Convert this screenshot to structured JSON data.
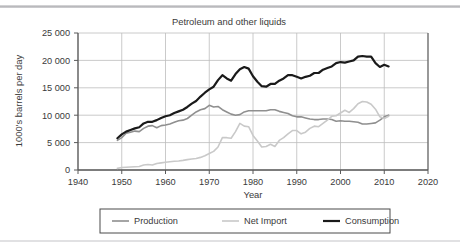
{
  "chart_data": {
    "type": "line",
    "title": "Petroleum and other liquids",
    "xlabel": "Year",
    "ylabel": "1000's barrels per day",
    "xlim": [
      1940,
      2020
    ],
    "ylim": [
      0,
      25000
    ],
    "xticks": [
      "1940",
      "1950",
      "1960",
      "1970",
      "1980",
      "1990",
      "2000",
      "2010",
      "2020"
    ],
    "yticks": [
      "0",
      "5 000",
      "10 000",
      "15 000",
      "20 000",
      "25 000"
    ],
    "grid": "both",
    "legend_position": "below",
    "series": [
      {
        "name": "Production",
        "color": "#8f8f8f",
        "width": 1.6,
        "x": [
          1949,
          1950,
          1951,
          1952,
          1953,
          1954,
          1955,
          1956,
          1957,
          1958,
          1959,
          1960,
          1961,
          1962,
          1963,
          1964,
          1965,
          1966,
          1967,
          1968,
          1969,
          1970,
          1971,
          1972,
          1973,
          1974,
          1975,
          1976,
          1977,
          1978,
          1979,
          1980,
          1981,
          1982,
          1983,
          1984,
          1985,
          1986,
          1987,
          1988,
          1989,
          1990,
          1991,
          1992,
          1993,
          1994,
          1995,
          1996,
          1997,
          1998,
          1999,
          2000,
          2001,
          2002,
          2003,
          2004,
          2005,
          2006,
          2007,
          2008,
          2009,
          2010,
          2011
        ],
        "y": [
          5400,
          5900,
          6700,
          6900,
          7100,
          7000,
          7600,
          8000,
          8100,
          7700,
          8100,
          8200,
          8400,
          8700,
          9000,
          9100,
          9400,
          10000,
          10600,
          11000,
          11200,
          11800,
          11500,
          11600,
          11000,
          10600,
          10200,
          10000,
          10100,
          10600,
          10800,
          10800,
          10800,
          10800,
          10800,
          11000,
          11000,
          10700,
          10500,
          10300,
          9900,
          9700,
          9700,
          9500,
          9300,
          9200,
          9200,
          9300,
          9300,
          9200,
          8900,
          9000,
          8900,
          8900,
          8800,
          8700,
          8400,
          8400,
          8500,
          8600,
          9100,
          9700,
          10000
        ]
      },
      {
        "name": "Net Import",
        "color": "#c9c9c9",
        "width": 1.6,
        "x": [
          1949,
          1950,
          1951,
          1952,
          1953,
          1954,
          1955,
          1956,
          1957,
          1958,
          1959,
          1960,
          1961,
          1962,
          1963,
          1964,
          1965,
          1966,
          1967,
          1968,
          1969,
          1970,
          1971,
          1972,
          1973,
          1974,
          1975,
          1976,
          1977,
          1978,
          1979,
          1980,
          1981,
          1982,
          1983,
          1984,
          1985,
          1986,
          1987,
          1988,
          1989,
          1990,
          1991,
          1992,
          1993,
          1994,
          1995,
          1996,
          1997,
          1998,
          1999,
          2000,
          2001,
          2002,
          2003,
          2004,
          2005,
          2006,
          2007,
          2008,
          2009,
          2010,
          2011
        ],
        "y": [
          300,
          450,
          500,
          550,
          600,
          650,
          900,
          1000,
          900,
          1200,
          1300,
          1400,
          1500,
          1600,
          1650,
          1750,
          1900,
          2000,
          2100,
          2300,
          2600,
          3000,
          3400,
          4200,
          5900,
          5900,
          5800,
          7000,
          8500,
          8000,
          7900,
          6300,
          5300,
          4200,
          4300,
          4700,
          4300,
          5400,
          5900,
          6600,
          7200,
          7200,
          6600,
          6900,
          7600,
          8000,
          7900,
          8500,
          9100,
          9800,
          9900,
          10400,
          10900,
          10500,
          11200,
          12100,
          12500,
          12400,
          12000,
          11100,
          9700,
          9400,
          9800
        ]
      },
      {
        "name": "Consumption",
        "color": "#1a1a1a",
        "width": 2.2,
        "x": [
          1949,
          1950,
          1951,
          1952,
          1953,
          1954,
          1955,
          1956,
          1957,
          1958,
          1959,
          1960,
          1961,
          1962,
          1963,
          1964,
          1965,
          1966,
          1967,
          1968,
          1969,
          1970,
          1971,
          1972,
          1973,
          1974,
          1975,
          1976,
          1977,
          1978,
          1979,
          1980,
          1981,
          1982,
          1983,
          1984,
          1985,
          1986,
          1987,
          1988,
          1989,
          1990,
          1991,
          1992,
          1993,
          1994,
          1995,
          1996,
          1997,
          1998,
          1999,
          2000,
          2001,
          2002,
          2003,
          2004,
          2005,
          2006,
          2007,
          2008,
          2009,
          2010,
          2011
        ],
        "y": [
          5800,
          6500,
          7000,
          7300,
          7600,
          7800,
          8500,
          8800,
          8800,
          9100,
          9500,
          9800,
          10000,
          10400,
          10700,
          11000,
          11500,
          12100,
          12600,
          13400,
          14100,
          14700,
          15200,
          16400,
          17300,
          16700,
          16300,
          17500,
          18400,
          18800,
          18500,
          17100,
          16100,
          15300,
          15200,
          15700,
          15700,
          16300,
          16700,
          17300,
          17300,
          17000,
          16700,
          17000,
          17200,
          17700,
          17700,
          18300,
          18600,
          18900,
          19500,
          19700,
          19600,
          19800,
          20000,
          20700,
          20800,
          20700,
          20700,
          19500,
          18800,
          19200,
          18900
        ]
      }
    ]
  },
  "legend": {
    "items": [
      {
        "label": "Production"
      },
      {
        "label": "Net Import"
      },
      {
        "label": "Consumption"
      }
    ]
  }
}
